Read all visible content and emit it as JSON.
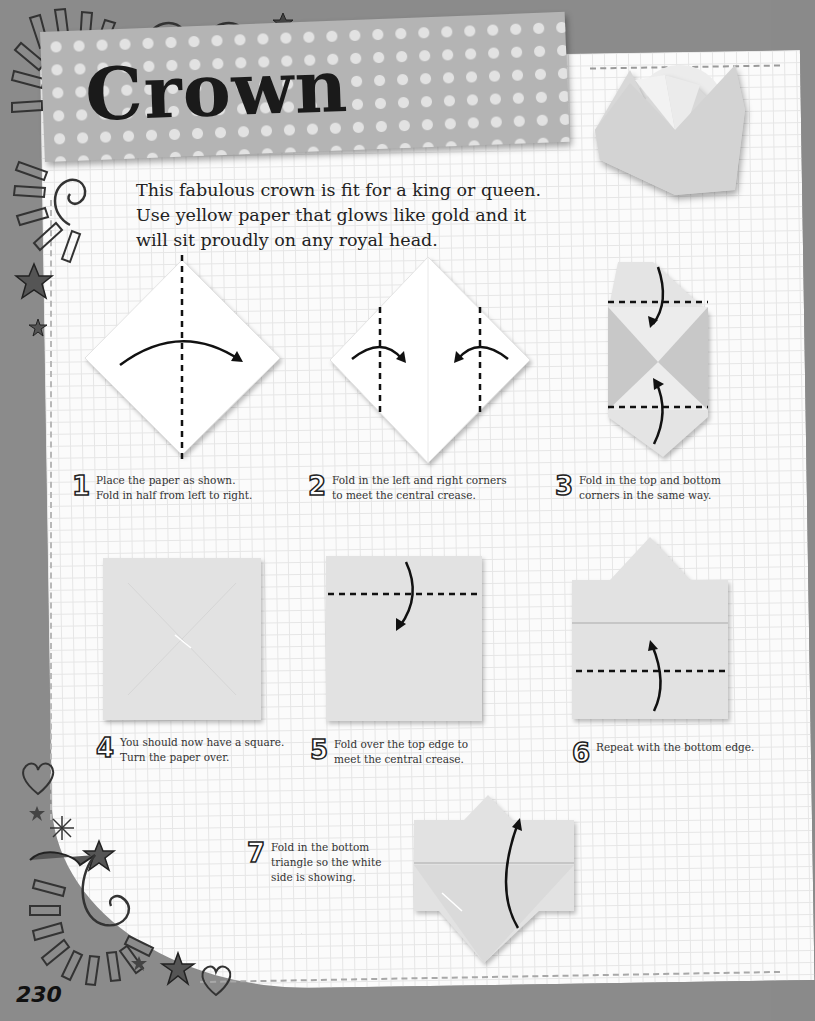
{
  "page": {
    "title": "Crown",
    "page_number": "230",
    "intro_lines": [
      "This fabulous crown is fit for a king or queen.",
      "Use yellow paper that glows like gold and it",
      "will sit proudly on any royal head."
    ]
  },
  "steps": [
    {
      "number": "1",
      "lines": [
        "Place the paper as shown.",
        "Fold in half from left to right."
      ]
    },
    {
      "number": "2",
      "lines": [
        "Fold in the left and right corners",
        "to meet the central crease."
      ]
    },
    {
      "number": "3",
      "lines": [
        "Fold in the top and bottom",
        "corners in the same way."
      ]
    },
    {
      "number": "4",
      "lines": [
        "You should now have a square.",
        "Turn the paper over."
      ]
    },
    {
      "number": "5",
      "lines": [
        "Fold over the top edge to",
        "meet the central crease."
      ]
    },
    {
      "number": "6",
      "lines": [
        "Repeat with the bottom edge."
      ]
    },
    {
      "number": "7",
      "lines": [
        "Fold in the bottom",
        "triangle so the white",
        "side is showing."
      ]
    }
  ],
  "icons": {
    "decorations": [
      "sunburst-icon",
      "spiral-icon",
      "star-icon",
      "heart-icon",
      "asterisk-icon"
    ],
    "fold_arrow": "curved-arrow-icon",
    "fold_line": "dashed-crease-line"
  },
  "colors": {
    "background": "#8b8b8b",
    "paper": "#fbfbfb",
    "grid": "#e6e6e6",
    "banner": "#b4b4b4",
    "banner_dots": "#e2e2e2",
    "origami_paper": "#dcdcdc",
    "origami_shade": "#c2c2c2",
    "ink": "#1a1a1a"
  }
}
